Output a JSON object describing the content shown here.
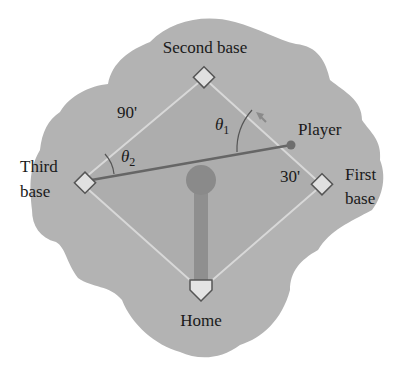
{
  "diagram": {
    "type": "baseball-diamond",
    "labels": {
      "second_base": "Second base",
      "third_base_line1": "Third",
      "third_base_line2": "base",
      "first_base_line1": "First",
      "first_base_line2": "base",
      "home": "Home",
      "player": "Player",
      "side_length": "90'",
      "player_distance": "30'",
      "theta1_symbol": "θ",
      "theta1_sub": "1",
      "theta2_symbol": "θ",
      "theta2_sub": "2"
    },
    "colors": {
      "field": "#b4b4b4",
      "infield": "#a9a9a9",
      "base_lines": "#d6d6d6",
      "base_fill": "#e2e2e2",
      "base_stroke": "#555555",
      "throw_line": "#666666",
      "player_dot": "#6e6e6e",
      "mound": "#8c8c8c",
      "text": "#1a1a1a"
    }
  }
}
